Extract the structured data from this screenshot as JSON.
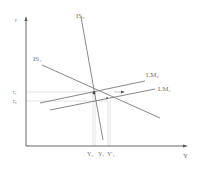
{
  "diagram": {
    "type": "IS-LM",
    "axes": {
      "y_label": "r",
      "x_label": "Y"
    },
    "curves": {
      "is0": "IS₀",
      "is1": "IS₁",
      "lm0": "LM₀",
      "lm1": "LM₁"
    },
    "y_ticks": {
      "r1": "r₁",
      "r0": "r₀"
    },
    "x_ticks": {
      "y0": "Y₀",
      "y1": "Y₁",
      "y1p": "Y'₁"
    },
    "colors": {
      "axis": "#666666",
      "curve": "#7a7a7a",
      "guide": "#d8d8d8",
      "label": "#777777"
    }
  }
}
